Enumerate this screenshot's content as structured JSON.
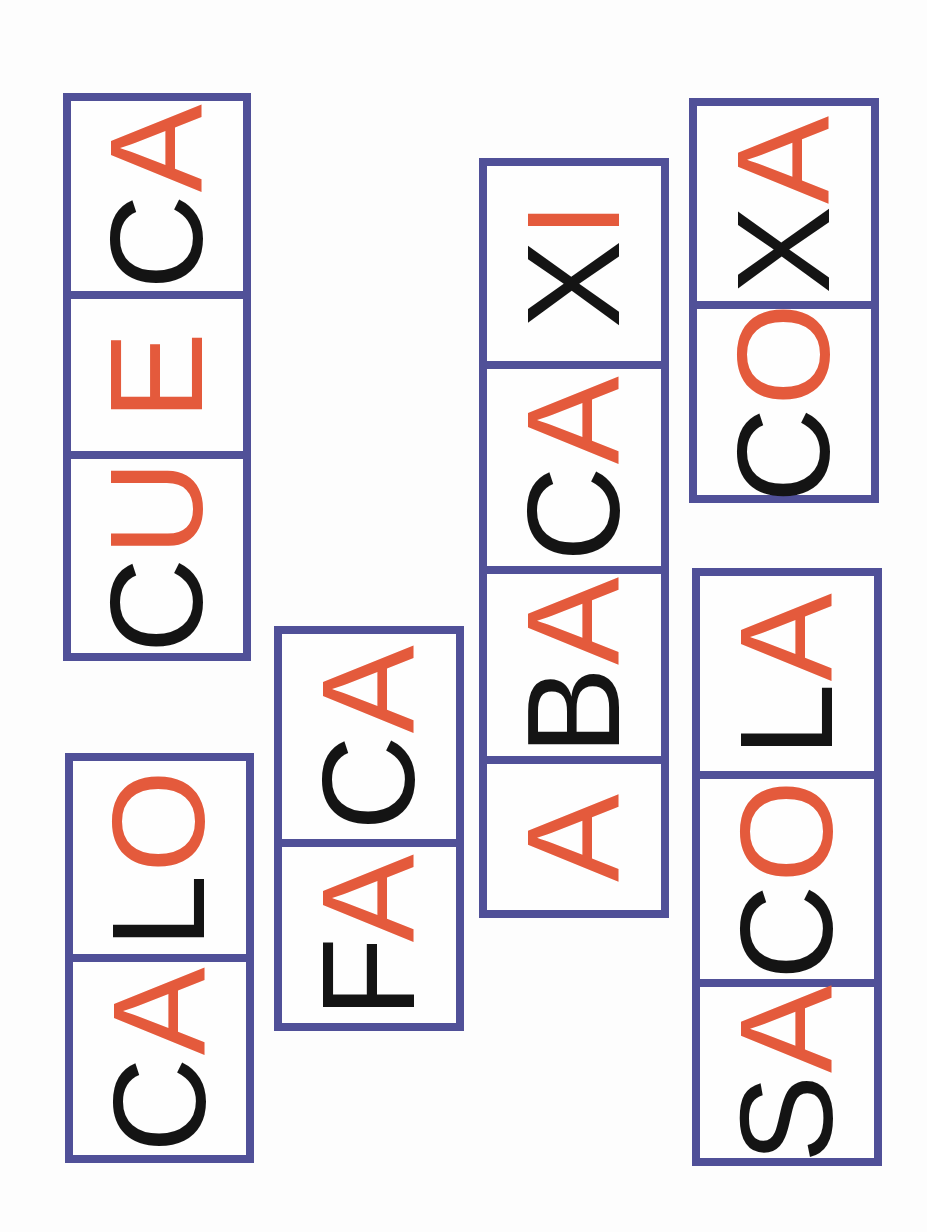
{
  "page": {
    "colors": {
      "border": "#505098",
      "consonant": "#141414",
      "vowel": "#e45a3c",
      "background": "#fdfdfd"
    },
    "words": [
      {
        "word": "CUECA",
        "syllables": [
          {
            "consonant": "C",
            "vowel": "U"
          },
          {
            "consonant": "",
            "vowel": "E"
          },
          {
            "consonant": "C",
            "vowel": "A"
          }
        ]
      },
      {
        "word": "CALO",
        "syllables": [
          {
            "consonant": "C",
            "vowel": "A"
          },
          {
            "consonant": "L",
            "vowel": "O"
          }
        ]
      },
      {
        "word": "FACA",
        "syllables": [
          {
            "consonant": "F",
            "vowel": "A"
          },
          {
            "consonant": "C",
            "vowel": "A"
          }
        ]
      },
      {
        "word": "ABACAXI",
        "syllables": [
          {
            "consonant": "",
            "vowel": "A"
          },
          {
            "consonant": "B",
            "vowel": "A"
          },
          {
            "consonant": "C",
            "vowel": "A"
          },
          {
            "consonant": "X",
            "vowel": "I"
          }
        ]
      },
      {
        "word": "COXA",
        "syllables": [
          {
            "consonant": "C",
            "vowel": "O"
          },
          {
            "consonant": "X",
            "vowel": "A"
          }
        ]
      },
      {
        "word": "SACOLA",
        "syllables": [
          {
            "consonant": "S",
            "vowel": "A"
          },
          {
            "consonant": "C",
            "vowel": "O"
          },
          {
            "consonant": "L",
            "vowel": "A"
          }
        ]
      }
    ]
  }
}
